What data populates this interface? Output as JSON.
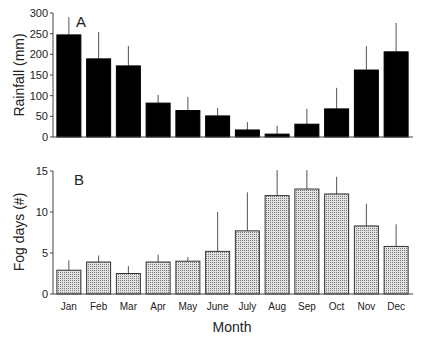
{
  "chart_data": [
    {
      "panel": "A",
      "type": "bar",
      "title": "",
      "panel_label": "A",
      "xlabel": "",
      "ylabel": "Rainfall (mm)",
      "ylim": [
        0,
        300
      ],
      "yticks": [
        0,
        50,
        100,
        150,
        200,
        250,
        300
      ],
      "grid": false,
      "bar_color": "#000000",
      "categories": [
        "Jan",
        "Feb",
        "Mar",
        "Apr",
        "May",
        "June",
        "July",
        "Aug",
        "Sep",
        "Oct",
        "Nov",
        "Dec"
      ],
      "values": [
        247,
        189,
        172,
        82,
        64,
        51,
        17,
        7,
        31,
        68,
        162,
        206
      ],
      "error_upper": [
        290,
        254,
        220,
        102,
        97,
        70,
        36,
        27,
        68,
        119,
        220,
        276
      ]
    },
    {
      "panel": "B",
      "type": "bar",
      "title": "",
      "panel_label": "B",
      "xlabel": "Month",
      "ylabel": "Fog days (#)",
      "ylim": [
        0,
        15
      ],
      "yticks": [
        0,
        5,
        10,
        15
      ],
      "grid": false,
      "bar_color": "#c8c8c8",
      "bar_pattern": "stippled",
      "categories": [
        "Jan",
        "Feb",
        "Mar",
        "Apr",
        "May",
        "June",
        "July",
        "Aug",
        "Sep",
        "Oct",
        "Nov",
        "Dec"
      ],
      "values": [
        2.9,
        3.9,
        2.5,
        3.9,
        4.0,
        5.2,
        7.7,
        12.0,
        12.8,
        12.2,
        8.3,
        5.8
      ],
      "error_upper": [
        4.1,
        4.7,
        3.4,
        4.8,
        4.5,
        10.0,
        12.4,
        15.1,
        15.1,
        14.3,
        11.0,
        8.5
      ]
    }
  ],
  "labels": {
    "panel_a": "A",
    "panel_b": "B",
    "ylabel_a": "Rainfall (mm)",
    "ylabel_b": "Fog days (#)",
    "xlabel": "Month"
  }
}
